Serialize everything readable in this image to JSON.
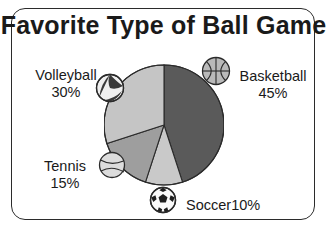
{
  "chart_data": {
    "type": "pie",
    "title": "Favorite Type of Ball Game",
    "categories": [
      "Basketball",
      "Soccer",
      "Tennis",
      "Volleyball"
    ],
    "values": [
      45,
      10,
      15,
      30
    ],
    "value_unit": "%",
    "start_angle_deg": 0,
    "direction": "clockwise",
    "legend": "none",
    "grid": false,
    "slices": [
      {
        "label": "Basketball",
        "value": 45,
        "pct_text": "45%",
        "color": "#5a5a5a",
        "icon": "basketball-icon"
      },
      {
        "label": "Soccer",
        "value": 10,
        "pct_text": "10%",
        "color": "#c9c9c9",
        "icon": "soccer-ball-icon"
      },
      {
        "label": "Tennis",
        "value": 15,
        "pct_text": "15%",
        "color": "#9e9e9e",
        "icon": "tennis-ball-icon"
      },
      {
        "label": "Volleyball",
        "value": 30,
        "pct_text": "30%",
        "color": "#c5c5c5",
        "icon": "volleyball-icon"
      }
    ]
  },
  "title": "Favorite Type of Ball Game",
  "labels": {
    "volleyball_name": "Volleyball",
    "volleyball_pct": "30%",
    "basketball_name": "Basketball",
    "basketball_pct": "45%",
    "tennis_name": "Tennis",
    "tennis_pct": "15%",
    "soccer_name": "Soccer",
    "soccer_pct": "10%"
  },
  "colors": {
    "basketball_slice": "#5a5a5a",
    "soccer_slice": "#c9c9c9",
    "tennis_slice": "#9e9e9e",
    "volleyball_slice": "#c5c5c5",
    "outline": "#2b2b2b",
    "text": "#1a1a1a",
    "background": "#ffffff"
  }
}
